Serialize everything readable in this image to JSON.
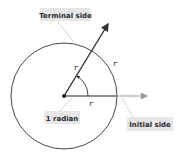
{
  "diagram": {
    "labels": {
      "terminal_side": "Terminal side",
      "initial_side": "Initial side",
      "angle": "1 radian",
      "radius_terminal": "r",
      "radius_arc": "r",
      "radius_initial": "r"
    },
    "colors": {
      "circle": "#333333",
      "terminal_arrow": "#333333",
      "initial_arrow": "#9a9a9a",
      "label_bg": "#e6e6e6",
      "leader": "#bdbdbd"
    }
  }
}
